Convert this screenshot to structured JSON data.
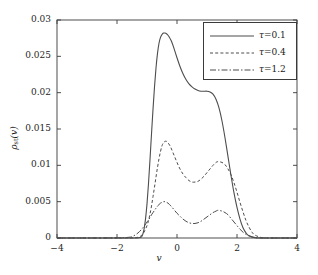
{
  "chart_data": {
    "type": "line",
    "title": "",
    "xlabel": "v",
    "ylabel": "ρst(v)",
    "ylabel_base": "ρ",
    "ylabel_sub": "st",
    "ylabel_arg": "(v)",
    "xlim": [
      -4,
      4
    ],
    "ylim": [
      0,
      0.03
    ],
    "xticks": [
      -4,
      -2,
      0,
      2,
      4
    ],
    "xticklabels": [
      "−4",
      "−2",
      "0",
      "2",
      "4"
    ],
    "yticks": [
      0,
      0.005,
      0.01,
      0.015,
      0.02,
      0.025,
      0.03
    ],
    "yticklabels": [
      "0",
      "0.005",
      "0.01",
      "0.015",
      "0.02",
      "0.025",
      "0.03"
    ],
    "grid": false,
    "legend_position": "upper right",
    "line_color": "#4d4d4d",
    "axis_color": "#3a3a3a",
    "series": [
      {
        "name": "τ=0.1",
        "label_var": "τ",
        "label_value": "=0.1",
        "style": "solid",
        "dasharray": "",
        "x": [
          -4.0,
          -3.0,
          -2.0,
          -1.6,
          -1.4,
          -1.3,
          -1.2,
          -1.15,
          -1.1,
          -1.05,
          -1.0,
          -0.95,
          -0.9,
          -0.85,
          -0.8,
          -0.75,
          -0.7,
          -0.65,
          -0.6,
          -0.55,
          -0.5,
          -0.45,
          -0.4,
          -0.35,
          -0.3,
          -0.25,
          -0.2,
          -0.15,
          -0.1,
          0.0,
          0.1,
          0.2,
          0.3,
          0.4,
          0.5,
          0.6,
          0.7,
          0.8,
          0.9,
          1.0,
          1.1,
          1.2,
          1.3,
          1.4,
          1.5,
          1.6,
          1.7,
          1.8,
          1.9,
          2.0,
          2.1,
          2.2,
          2.3,
          2.4,
          2.6,
          3.0,
          4.0
        ],
        "y": [
          0.0,
          0.0,
          0.0,
          0.0,
          0.0,
          2e-05,
          0.0001,
          0.0004,
          0.0012,
          0.0026,
          0.0047,
          0.0075,
          0.0108,
          0.0143,
          0.0177,
          0.0208,
          0.0234,
          0.0254,
          0.0268,
          0.0276,
          0.028,
          0.0282,
          0.0282,
          0.0281,
          0.0279,
          0.0276,
          0.0272,
          0.0267,
          0.0261,
          0.0248,
          0.0236,
          0.0226,
          0.0218,
          0.0212,
          0.0208,
          0.0205,
          0.0203,
          0.0202,
          0.0202,
          0.0202,
          0.0201,
          0.0198,
          0.0191,
          0.0179,
          0.0161,
          0.0138,
          0.0112,
          0.0086,
          0.0062,
          0.0042,
          0.0026,
          0.0014,
          0.0007,
          0.0003,
          5e-05,
          0.0,
          0.0
        ]
      },
      {
        "name": "τ=0.4",
        "label_var": "τ",
        "label_value": "=0.4",
        "style": "dashed",
        "dasharray": "3,2.2",
        "x": [
          -4.0,
          -3.0,
          -2.0,
          -1.5,
          -1.3,
          -1.2,
          -1.1,
          -1.0,
          -0.95,
          -0.9,
          -0.85,
          -0.8,
          -0.75,
          -0.7,
          -0.65,
          -0.6,
          -0.55,
          -0.5,
          -0.45,
          -0.4,
          -0.35,
          -0.3,
          -0.25,
          -0.2,
          -0.1,
          0.0,
          0.1,
          0.2,
          0.3,
          0.4,
          0.5,
          0.6,
          0.7,
          0.8,
          0.9,
          1.0,
          1.1,
          1.2,
          1.3,
          1.35,
          1.4,
          1.5,
          1.6,
          1.7,
          1.8,
          1.9,
          2.0,
          2.1,
          2.2,
          2.3,
          2.4,
          2.5,
          2.6,
          2.8,
          3.0,
          4.0
        ],
        "y": [
          0.0,
          0.0,
          0.0,
          2e-05,
          0.0001,
          0.0003,
          0.0008,
          0.0017,
          0.0024,
          0.0033,
          0.0044,
          0.0057,
          0.007,
          0.0084,
          0.0097,
          0.0109,
          0.0119,
          0.0127,
          0.0131,
          0.0133,
          0.0133,
          0.0131,
          0.0128,
          0.0124,
          0.0114,
          0.0104,
          0.0095,
          0.0088,
          0.0083,
          0.0079,
          0.0077,
          0.0077,
          0.0078,
          0.0081,
          0.0085,
          0.009,
          0.0095,
          0.01,
          0.0104,
          0.0105,
          0.0105,
          0.0104,
          0.0101,
          0.0095,
          0.0087,
          0.0076,
          0.0063,
          0.0049,
          0.0036,
          0.0024,
          0.0015,
          0.0008,
          0.0004,
          8e-05,
          0.0,
          0.0
        ]
      },
      {
        "name": "τ=1.2",
        "label_var": "τ",
        "label_value": "=1.2",
        "style": "dashdot",
        "dasharray": "6,2,1.5,2",
        "x": [
          -4.0,
          -3.0,
          -2.0,
          -1.6,
          -1.5,
          -1.4,
          -1.3,
          -1.2,
          -1.1,
          -1.0,
          -0.95,
          -0.9,
          -0.85,
          -0.8,
          -0.75,
          -0.7,
          -0.65,
          -0.6,
          -0.55,
          -0.5,
          -0.45,
          -0.4,
          -0.35,
          -0.3,
          -0.25,
          -0.2,
          -0.1,
          0.0,
          0.1,
          0.2,
          0.3,
          0.4,
          0.5,
          0.6,
          0.7,
          0.8,
          0.9,
          1.0,
          1.1,
          1.2,
          1.3,
          1.35,
          1.4,
          1.5,
          1.6,
          1.7,
          1.8,
          1.9,
          2.0,
          2.1,
          2.2,
          2.3,
          2.4,
          2.6,
          3.0,
          4.0
        ],
        "y": [
          0.0,
          0.0,
          2e-05,
          0.0001,
          0.0002,
          0.0004,
          0.0007,
          0.0011,
          0.0016,
          0.0022,
          0.0025,
          0.0028,
          0.0032,
          0.0035,
          0.0038,
          0.0041,
          0.0044,
          0.0046,
          0.0048,
          0.0049,
          0.005,
          0.005,
          0.0049,
          0.0048,
          0.0046,
          0.0044,
          0.0039,
          0.0034,
          0.003,
          0.0026,
          0.0023,
          0.0021,
          0.002,
          0.002,
          0.0021,
          0.0023,
          0.0026,
          0.0029,
          0.0032,
          0.0035,
          0.0037,
          0.0038,
          0.0038,
          0.0037,
          0.0035,
          0.0032,
          0.0027,
          0.0022,
          0.0017,
          0.0012,
          0.0008,
          0.0005,
          0.0003,
          5e-05,
          0.0,
          0.0
        ]
      }
    ]
  }
}
